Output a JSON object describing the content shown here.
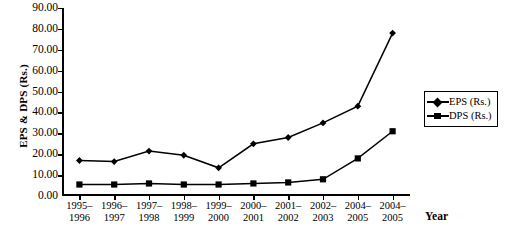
{
  "chart_data": {
    "type": "line",
    "title": "",
    "xlabel": "Year",
    "ylabel": "EPS & DPS (Rs.)",
    "ylim": [
      0,
      90
    ],
    "ytick_step": 10,
    "grid": false,
    "legend_position": "right",
    "categories": [
      "1995–1996",
      "1996–1997",
      "1997–1998",
      "1998–1999",
      "1999–2000",
      "2000–2001",
      "2001–2002",
      "2002–2003",
      "2004–2005",
      "2004–2005"
    ],
    "ytick_labels": [
      "0.00",
      "10.00",
      "20.00",
      "30.00",
      "40.00",
      "50.00",
      "60.00",
      "70.00",
      "80.00",
      "90.00"
    ],
    "series": [
      {
        "name": "EPS (Rs.)",
        "marker": "diamond",
        "color": "#000000",
        "values": [
          17.0,
          16.5,
          21.5,
          19.5,
          13.5,
          25.0,
          28.0,
          35.0,
          43.0,
          78.0
        ]
      },
      {
        "name": "DPS (Rs.)",
        "marker": "square",
        "color": "#000000",
        "values": [
          5.5,
          5.5,
          6.0,
          5.5,
          5.5,
          6.0,
          6.5,
          8.0,
          18.0,
          31.0
        ]
      }
    ]
  }
}
